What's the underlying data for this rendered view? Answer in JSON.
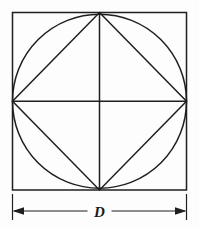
{
  "figure": {
    "background_color": "#fdfdfd",
    "stroke_color": "#1f1f1f",
    "stroke_width": 1.5,
    "dimension_label": "D",
    "shapes": {
      "outer_square": {
        "name": "outer-square",
        "x": 12.5,
        "y": 12.5,
        "width": 174,
        "height": 177.5
      },
      "inscribed_circle": {
        "name": "inscribed-circle",
        "cx": 99.5,
        "cy": 101.25,
        "r": 87
      },
      "inscribed_diamond": {
        "name": "inscribed-diamond",
        "points": "99.5,12.5 186.5,101.25 99.5,190 12.5,101.25"
      },
      "vertical_axis": {
        "name": "vertical-center-line",
        "x1": 99.5,
        "y1": 12.5,
        "x2": 99.5,
        "y2": 190
      },
      "horizontal_axis": {
        "name": "horizontal-center-line",
        "x1": 12.5,
        "y1": 101.25,
        "x2": 186.5,
        "y2": 101.25
      }
    },
    "dimension": {
      "name": "width-dimension",
      "line_y": 211,
      "x_start": 12.5,
      "x_end": 186.5,
      "extension_left_x": 12.5,
      "extension_right_x": 186.5,
      "extension_y_top": 194,
      "extension_y_bottom": 220,
      "label_x": 99.5,
      "label_y": 216,
      "label_gap_half_width": 12
    }
  }
}
